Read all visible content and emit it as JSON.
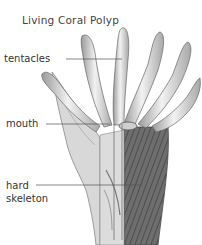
{
  "diagram": {
    "title": "Living Coral Polyp",
    "labels": [
      {
        "id": "tentacles",
        "text": "tentacles"
      },
      {
        "id": "mouth",
        "text": "mouth"
      },
      {
        "id": "hard-skeleton",
        "line1": "hard",
        "line2": "skeleton"
      }
    ],
    "colors": {
      "background": "#ffffff",
      "ink": "#333333",
      "tissue_light": "#e4e4e4",
      "tissue_mid": "#b8b8b8",
      "skeleton_dark": "#6a6a6a"
    }
  }
}
